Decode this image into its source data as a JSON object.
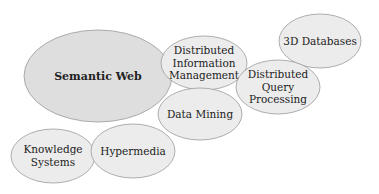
{
  "diagram": {
    "type": "bubble-cluster",
    "colors": {
      "primary_fill": "#dedede",
      "secondary_fill": "#ececec",
      "stroke": "#9a9a9a",
      "text": "#222222",
      "background": "#ffffff"
    },
    "nodes": [
      {
        "id": "semantic-web",
        "lines": [
          "Semantic Web"
        ],
        "bold": true,
        "cx": 98,
        "cy": 76,
        "rx": 74,
        "ry": 46,
        "fill": "primary"
      },
      {
        "id": "distributed-information-management",
        "lines": [
          "Distributed",
          "Information",
          "Management"
        ],
        "bold": false,
        "cx": 204,
        "cy": 63,
        "rx": 43,
        "ry": 27,
        "fill": "secondary"
      },
      {
        "id": "3d-databases",
        "lines": [
          "3D Databases"
        ],
        "bold": false,
        "cx": 320,
        "cy": 41,
        "rx": 41,
        "ry": 27,
        "fill": "secondary"
      },
      {
        "id": "distributed-query-processing",
        "lines": [
          "Distributed",
          "Query",
          "Processing"
        ],
        "bold": false,
        "cx": 278,
        "cy": 87,
        "rx": 42,
        "ry": 27,
        "fill": "secondary"
      },
      {
        "id": "data-mining",
        "lines": [
          "Data Mining"
        ],
        "bold": false,
        "cx": 200,
        "cy": 114,
        "rx": 42,
        "ry": 26,
        "fill": "secondary"
      },
      {
        "id": "knowledge-systems",
        "lines": [
          "Knowledge",
          "Systems"
        ],
        "bold": false,
        "cx": 53,
        "cy": 156,
        "rx": 42,
        "ry": 27,
        "fill": "secondary"
      },
      {
        "id": "hypermedia",
        "lines": [
          "Hypermedia"
        ],
        "bold": false,
        "cx": 133,
        "cy": 151,
        "rx": 42,
        "ry": 27,
        "fill": "secondary"
      }
    ]
  }
}
